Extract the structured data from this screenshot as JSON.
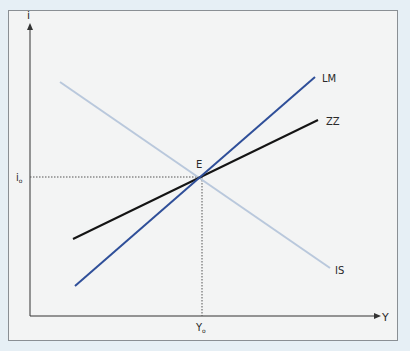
{
  "diagram": {
    "type": "IS-LM / ZZ equilibrium diagram",
    "axes": {
      "y_label": "i",
      "x_label": "Y"
    },
    "equilibrium": {
      "label": "E",
      "i_label": "i",
      "i_sub": "o",
      "y_label": "Y",
      "y_sub": "o"
    },
    "curves": [
      {
        "id": "IS",
        "label": "IS",
        "color": "#b9c8dc",
        "slope": "downward"
      },
      {
        "id": "LM",
        "label": "LM",
        "color": "#2f4f99",
        "slope": "upward-steep"
      },
      {
        "id": "ZZ",
        "label": "ZZ",
        "color": "#141414",
        "slope": "upward-flat"
      }
    ],
    "colors": {
      "page_background": "#e6eff5",
      "panel_background": "#f2f4f5",
      "panel_border": "#8a8f94",
      "axis": "#333333",
      "guide_dotted": "#555555"
    }
  }
}
